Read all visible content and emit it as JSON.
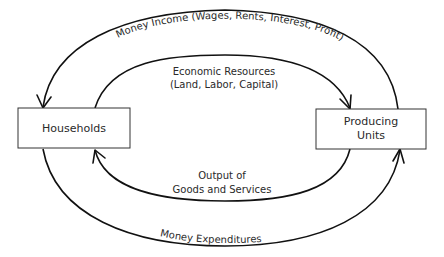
{
  "diagram": {
    "nodes": {
      "households": {
        "label": "Households"
      },
      "producing_units": {
        "line1": "Producing",
        "line2": "Units"
      }
    },
    "flows": {
      "money_income": {
        "label": "Money Income (Wages, Rents, Interest, Profit)"
      },
      "economic_resources": {
        "line1": "Economic Resources",
        "line2": "(Land, Labor, Capital)"
      },
      "output": {
        "line1": "Output of",
        "line2": "Goods and Services"
      },
      "money_expenditures": {
        "label": "Money Expenditures"
      }
    }
  }
}
